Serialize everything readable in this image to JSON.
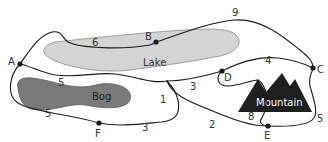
{
  "diagram": {
    "type": "trail-network-map",
    "colors": {
      "lake_fill": "#d4d4d4",
      "lake_stroke": "#8a8a8a",
      "bog_fill": "#7a7a7a",
      "bog_stroke": "#5e5e5e",
      "mountain_fill": "#1f1f1f",
      "trail": "#1a1a1a",
      "lake_text": "#333333",
      "bog_text": "#222222",
      "mountain_text": "#ffffff"
    },
    "regions": {
      "lake": "Lake",
      "bog": "Bog",
      "mountain": "Mountain"
    },
    "nodes": {
      "A": "A",
      "B": "B",
      "C": "C",
      "D": "D",
      "E": "E",
      "F": "F"
    },
    "edges": [
      {
        "from": "A",
        "to": "B",
        "weight": "6"
      },
      {
        "from": "B",
        "to": "C",
        "weight": "9"
      },
      {
        "from": "A",
        "to": "junction",
        "weight": "5",
        "note": "upper path between lake and bog"
      },
      {
        "from": "A",
        "to": "F",
        "weight": "5"
      },
      {
        "from": "F",
        "to": "junction",
        "weight": "3"
      },
      {
        "from": "junction",
        "to": "D",
        "weight": "3"
      },
      {
        "from": "junction",
        "to": "loop",
        "weight": "1"
      },
      {
        "from": "junction",
        "to": "E",
        "weight": "2"
      },
      {
        "from": "D",
        "to": "C",
        "weight": "4"
      },
      {
        "from": "D",
        "to": "E",
        "weight": "8"
      },
      {
        "from": "C",
        "to": "E",
        "weight": "5"
      }
    ],
    "weight_labels": {
      "w6": "6",
      "w9": "9",
      "w5_upper": "5",
      "w5_lower": "5",
      "w3_bottom": "3",
      "w1": "1",
      "w3_mid": "3",
      "w4": "4",
      "w2": "2",
      "w8": "8",
      "w5_right": "5"
    }
  }
}
